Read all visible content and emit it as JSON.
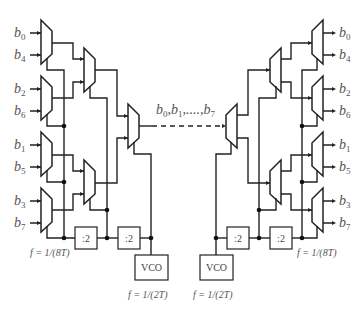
{
  "diagram": {
    "type": "serializer-deserializer tree",
    "left": {
      "inputs": [
        {
          "label": "b",
          "sub": "0"
        },
        {
          "label": "b",
          "sub": "4"
        },
        {
          "label": "b",
          "sub": "2"
        },
        {
          "label": "b",
          "sub": "6"
        },
        {
          "label": "b",
          "sub": "1"
        },
        {
          "label": "b",
          "sub": "5"
        },
        {
          "label": "b",
          "sub": "3"
        },
        {
          "label": "b",
          "sub": "7"
        }
      ],
      "divider1": ":2",
      "divider2": ":2",
      "vco": "VCO",
      "freq_low": "f = 1/(8T)",
      "freq_vco": "f = 1/(2T)"
    },
    "right": {
      "outputs": [
        {
          "label": "b",
          "sub": "0"
        },
        {
          "label": "b",
          "sub": "4"
        },
        {
          "label": "b",
          "sub": "2"
        },
        {
          "label": "b",
          "sub": "6"
        },
        {
          "label": "b",
          "sub": "1"
        },
        {
          "label": "b",
          "sub": "5"
        },
        {
          "label": "b",
          "sub": "3"
        },
        {
          "label": "b",
          "sub": "7"
        }
      ],
      "divider1": ":2",
      "divider2": ":2",
      "vco": "VCO",
      "freq_low": "f = 1/(8T)",
      "freq_vco": "f = 1/(2T)"
    },
    "link_label": "b0, b1, ..., b7",
    "link_parts": {
      "b": "b",
      "s0": "0",
      "s1": "1",
      "s7": "7",
      "sep": ",",
      "dots": ",....,"
    }
  }
}
